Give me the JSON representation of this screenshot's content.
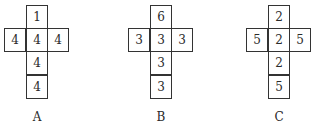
{
  "nets": [
    {
      "label": "A",
      "top": "1",
      "middle_row": [
        "4",
        "4",
        "4"
      ],
      "below": [
        "4",
        "4"
      ]
    },
    {
      "label": "B",
      "top": "6",
      "middle_row": [
        "3",
        "3",
        "3"
      ],
      "below": [
        "3",
        "3"
      ]
    },
    {
      "label": "C",
      "top": "2",
      "middle_row": [
        "5",
        "2",
        "5"
      ],
      "below": [
        "2",
        "5"
      ]
    }
  ]
}
